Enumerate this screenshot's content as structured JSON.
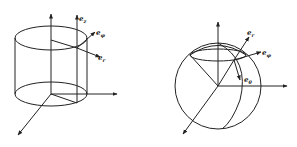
{
  "figures": [
    {
      "id": "cylindrical",
      "description": "Cylindrical coordinate system with unit vectors",
      "labels": {
        "ez": {
          "base": "e",
          "sub": "z"
        },
        "ephi": {
          "base": "e",
          "sub": "φ"
        },
        "er": {
          "base": "e",
          "sub": "r"
        }
      }
    },
    {
      "id": "spherical",
      "description": "Spherical coordinate system with unit vectors",
      "labels": {
        "er": {
          "base": "e",
          "sub": "r"
        },
        "ephi": {
          "base": "e",
          "sub": "φ"
        },
        "etheta": {
          "base": "e",
          "sub": "θ"
        }
      }
    }
  ],
  "colors": {
    "line": "#222222",
    "background": "#ffffff"
  }
}
